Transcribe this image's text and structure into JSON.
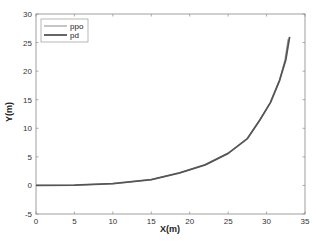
{
  "chart_data": {
    "type": "line",
    "title": "",
    "xlabel": "X(m)",
    "ylabel": "Y(m)",
    "xlim": [
      0,
      35
    ],
    "ylim": [
      -5,
      30
    ],
    "xticks": [
      0,
      5,
      10,
      15,
      20,
      25,
      30,
      35
    ],
    "yticks": [
      -5,
      0,
      5,
      10,
      15,
      20,
      25,
      30
    ],
    "grid": false,
    "legend_position": "upper left",
    "series": [
      {
        "name": "ppo",
        "color": "#a0a0a0",
        "x": [
          0,
          5,
          10,
          15,
          18.7,
          22,
          25,
          27.5,
          29.1,
          30.5,
          31.7,
          32.4,
          32.8
        ],
        "y": [
          0,
          0.05,
          0.3,
          1.0,
          2.2,
          3.6,
          5.6,
          8.2,
          11.4,
          14.5,
          18.4,
          22.0,
          25.6
        ]
      },
      {
        "name": "pd",
        "color": "#555555",
        "x": [
          0,
          5,
          10,
          15,
          18.7,
          22,
          25,
          27.5,
          29.1,
          30.5,
          31.7,
          32.5,
          33.0
        ],
        "y": [
          0,
          0.05,
          0.3,
          1.0,
          2.2,
          3.6,
          5.6,
          8.2,
          11.4,
          14.5,
          18.4,
          22.0,
          26.0
        ]
      }
    ]
  }
}
